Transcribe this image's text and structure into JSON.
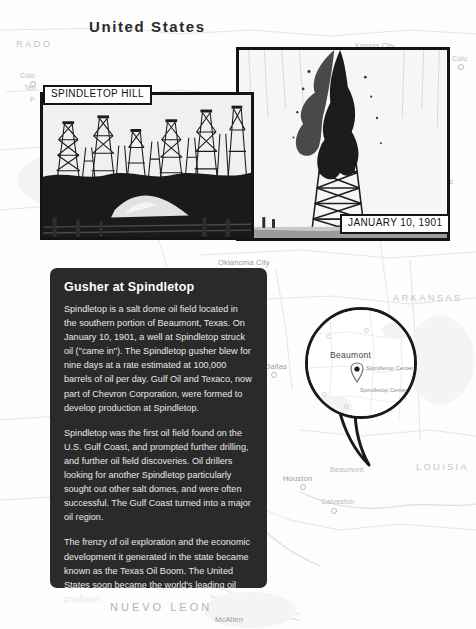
{
  "page": {
    "header_note": "INTERNAL WEB PAGE",
    "title": "United States"
  },
  "photos": [
    {
      "id": "spindletop-hill",
      "caption": "SPINDLETOP HILL",
      "alt": "Dense forest of wooden oil derricks at Spindletop Hill"
    },
    {
      "id": "gusher-1901",
      "caption": "JANUARY 10, 1901",
      "alt": "Black oil gusher erupting from a derrick"
    }
  ],
  "info_panel": {
    "title": "Gusher at Spindletop",
    "paragraphs": [
      "Spindletop is a salt dome oil field located in the southern portion of Beaumont, Texas. On January 10, 1901, a well at Spindletop struck oil (\"came in\"). The Spindletop gusher blew for nine days at a rate estimated at 100,000 barrels of oil per day. Gulf Oil and Texaco, now part of Chevron Corporation, were formed to develop production at Spindletop.",
      "Spindletop was the first oil field found on the U.S. Gulf Coast, and prompted further drilling, and further oil field discoveries. Oil drillers looking for another Spindletop particularly sought out other salt domes, and were often successful. The Gulf Coast turned into a major oil region.",
      "The frenzy of oil exploration and the economic development it generated in the state became known as the Texas Oil Boom. The United States soon became the world's leading oil producer."
    ]
  },
  "callout": {
    "city": "Beaumont",
    "marker_labels": [
      "Spindletop Center",
      "Spindletop Center"
    ]
  },
  "map": {
    "states": [
      {
        "name": "RADO",
        "x": 16,
        "y": 38,
        "size": 9.5
      },
      {
        "name": "RI",
        "x": 430,
        "y": 148,
        "size": 8.5
      },
      {
        "name": "ARKANSAS",
        "x": 393,
        "y": 292,
        "size": 9.5
      },
      {
        "name": "LOUISIA",
        "x": 416,
        "y": 461,
        "size": 9.5
      },
      {
        "name": "NUEVO LEON",
        "x": 110,
        "y": 601,
        "size": 11
      }
    ],
    "places": [
      {
        "name": "Colo",
        "x": 20,
        "y": 72,
        "dot": true,
        "dark": false
      },
      {
        "name": "Ten",
        "x": 24,
        "y": 84,
        "dot": false,
        "dark": false
      },
      {
        "name": "P",
        "x": 30,
        "y": 96,
        "dot": false,
        "dark": false
      },
      {
        "name": "Kansas City",
        "x": 355,
        "y": 42,
        "dot": false,
        "dark": false
      },
      {
        "name": "Colu",
        "x": 452,
        "y": 55,
        "dot": true,
        "dark": false
      },
      {
        "name": "Mark",
        "x": 432,
        "y": 168,
        "dot": false,
        "dark": false
      },
      {
        "name": "Nations",
        "x": 428,
        "y": 178,
        "dot": false,
        "dark": false
      },
      {
        "name": "Oklahoma City",
        "x": 218,
        "y": 258,
        "dot": true,
        "dark": true
      },
      {
        "name": "Dallas",
        "x": 265,
        "y": 362,
        "dot": true,
        "dark": true
      },
      {
        "name": "Houston",
        "x": 283,
        "y": 474,
        "dot": true,
        "dark": true
      },
      {
        "name": "Galveston",
        "x": 321,
        "y": 498,
        "dot": true,
        "dark": false
      },
      {
        "name": "Beaumont",
        "x": 330,
        "y": 466,
        "dot": false,
        "dark": false
      },
      {
        "name": "McAllen",
        "x": 215,
        "y": 615,
        "dot": false,
        "dark": true
      }
    ]
  },
  "colors": {
    "panel_bg": "#2a2a2a",
    "panel_text": "#e8e8e8",
    "frame": "#141414",
    "map_label": "#c9c9cd",
    "title": "#2b2b2b"
  }
}
